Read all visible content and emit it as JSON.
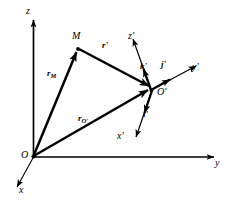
{
  "figure": {
    "type": "vector-diagram",
    "background_color": "#ffffff",
    "stroke_color": "#000000"
  },
  "axes": {
    "fixed": [
      {
        "name": "z-axis",
        "label": "z",
        "label_x": 26,
        "label_y": 6
      },
      {
        "name": "y-axis",
        "label": "y",
        "label_x": 215,
        "label_y": 158
      },
      {
        "name": "x-axis",
        "label": "x",
        "label_x": 19,
        "label_y": 185
      }
    ],
    "moving": [
      {
        "name": "z-prime-axis",
        "label": "z'",
        "label_x": 128,
        "label_y": 31
      },
      {
        "name": "y-prime-axis",
        "label": "y'",
        "label_x": 192,
        "label_y": 62
      },
      {
        "name": "x-prime-axis",
        "label": "x'",
        "label_x": 117,
        "label_y": 131
      }
    ]
  },
  "points": [
    {
      "name": "origin-O",
      "label": "O",
      "label_x": 21,
      "label_y": 150
    },
    {
      "name": "point-M",
      "label": "M",
      "label_x": 72,
      "label_y": 31
    },
    {
      "name": "origin-O-prime",
      "label": "O'",
      "label_x": 157,
      "label_y": 87
    }
  ],
  "vectors": [
    {
      "name": "vector-rM",
      "base": "r",
      "subscript": "M",
      "label_x": 47,
      "label_y": 69
    },
    {
      "name": "vector-rOprime",
      "base": "r",
      "subscript": "O'",
      "label_x": 78,
      "label_y": 114
    },
    {
      "name": "vector-r-prime",
      "base": "r'",
      "subscript": "",
      "label_x": 102,
      "label_y": 41
    }
  ],
  "unit_vectors": [
    {
      "name": "unit-vector-i-prime",
      "label": "i'",
      "label_x": 143,
      "label_y": 110
    },
    {
      "name": "unit-vector-j-prime",
      "label": "j'",
      "label_x": 161,
      "label_y": 60
    },
    {
      "name": "unit-vector-k-prime",
      "label": "k'",
      "label_x": 140,
      "label_y": 62
    }
  ]
}
